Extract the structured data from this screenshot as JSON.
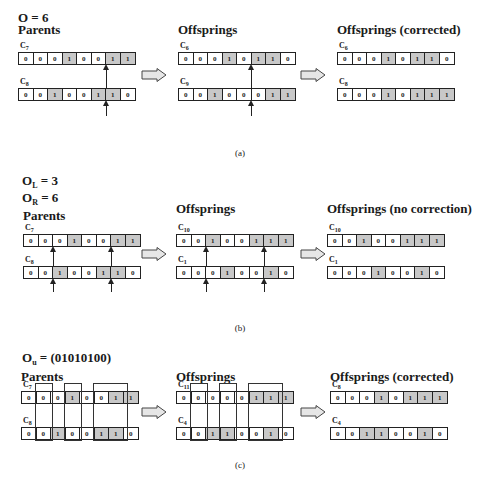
{
  "panels": [
    {
      "id": "a",
      "title_main": "O = 6",
      "caption": "(a)",
      "groups": [
        {
          "heading": "Parents",
          "chromosomes": [
            {
              "name": "C",
              "sub": "7",
              "bits": [
                0,
                0,
                0,
                1,
                0,
                0,
                1,
                1
              ]
            },
            {
              "name": "C",
              "sub": "8",
              "bits": [
                0,
                0,
                1,
                0,
                0,
                1,
                1,
                0
              ]
            }
          ]
        },
        {
          "heading": "Offsprings",
          "chromosomes": [
            {
              "name": "C",
              "sub": "6",
              "bits": [
                0,
                0,
                0,
                1,
                0,
                1,
                1,
                0
              ]
            },
            {
              "name": "C",
              "sub": "9",
              "bits": [
                0,
                0,
                1,
                0,
                0,
                0,
                1,
                1
              ]
            }
          ]
        },
        {
          "heading": "Offsprings (corrected)",
          "chromosomes": [
            {
              "name": "C",
              "sub": "6",
              "bits": [
                0,
                0,
                0,
                1,
                0,
                1,
                1,
                0
              ]
            },
            {
              "name": "C",
              "sub": "8",
              "bits": [
                0,
                0,
                0,
                1,
                0,
                1,
                1,
                1
              ]
            }
          ]
        }
      ]
    },
    {
      "id": "b",
      "title_lines": [
        {
          "main": "O",
          "sub": "L",
          "rest": " = 3"
        },
        {
          "main": "O",
          "sub": "R",
          "rest": " = 6"
        }
      ],
      "caption": "(b)",
      "groups": [
        {
          "heading": "Parents",
          "chromosomes": [
            {
              "name": "C",
              "sub": "7",
              "bits": [
                0,
                0,
                0,
                1,
                0,
                0,
                1,
                1
              ]
            },
            {
              "name": "C",
              "sub": "8",
              "bits": [
                0,
                0,
                1,
                0,
                0,
                1,
                1,
                0
              ]
            }
          ]
        },
        {
          "heading": "Offsprings",
          "chromosomes": [
            {
              "name": "C",
              "sub": "10",
              "bits": [
                0,
                0,
                1,
                0,
                0,
                1,
                1,
                1
              ]
            },
            {
              "name": "C",
              "sub": "1",
              "bits": [
                0,
                0,
                0,
                1,
                0,
                0,
                1,
                0
              ]
            }
          ]
        },
        {
          "heading": "Offsprings (no correction)",
          "chromosomes": [
            {
              "name": "C",
              "sub": "10",
              "bits": [
                0,
                0,
                1,
                0,
                0,
                1,
                1,
                1
              ]
            },
            {
              "name": "C",
              "sub": "1",
              "bits": [
                0,
                0,
                0,
                1,
                0,
                0,
                1,
                0
              ]
            }
          ]
        }
      ]
    },
    {
      "id": "c",
      "title_line": {
        "main": "O",
        "sub": "u",
        "rest": " = (01010100)"
      },
      "caption": "(c)",
      "groups": [
        {
          "heading": "Parents",
          "chromosomes": [
            {
              "name": "C",
              "sub": "7",
              "bits": [
                0,
                0,
                0,
                1,
                0,
                0,
                1,
                1
              ]
            },
            {
              "name": "C",
              "sub": "8",
              "bits": [
                0,
                0,
                1,
                0,
                0,
                1,
                1,
                0
              ]
            }
          ]
        },
        {
          "heading": "Offsprings",
          "chromosomes": [
            {
              "name": "C",
              "sub": "11",
              "bits": [
                0,
                0,
                0,
                0,
                0,
                1,
                1,
                1
              ]
            },
            {
              "name": "C",
              "sub": "4",
              "bits": [
                0,
                0,
                1,
                1,
                0,
                0,
                1,
                0
              ]
            }
          ]
        },
        {
          "heading": "Offsprings (corrected)",
          "chromosomes": [
            {
              "name": "C",
              "sub": "8",
              "bits": [
                0,
                0,
                0,
                1,
                0,
                1,
                1,
                1
              ]
            },
            {
              "name": "C",
              "sub": "4",
              "bits": [
                0,
                0,
                1,
                1,
                0,
                0,
                1,
                0
              ]
            }
          ]
        }
      ]
    }
  ]
}
